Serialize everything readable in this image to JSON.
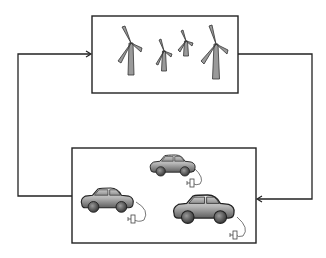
{
  "diagram": {
    "type": "closed-loop block diagram",
    "nodes": [
      {
        "id": "wind-farm",
        "label": "",
        "contents": "4 wind turbines",
        "icon": "wind-turbine-icon"
      },
      {
        "id": "electric-vehicles",
        "label": "",
        "contents": "3 plug-in electric cars",
        "icon": "electric-car-icon"
      }
    ],
    "edges": [
      {
        "from": "wind-farm",
        "to": "electric-vehicles",
        "route": "right side, downward",
        "arrow": "into left of bottom box right edge"
      },
      {
        "from": "electric-vehicles",
        "to": "wind-farm",
        "route": "left side, upward",
        "arrow": "into top box left edge"
      }
    ]
  },
  "colors": {
    "line": "#222222",
    "turbine_fill": "#9a9a9a",
    "car_body_light": "#e8e8e8",
    "car_body_dark": "#6e6e6e",
    "wheel": "#555555",
    "background": "#ffffff"
  }
}
